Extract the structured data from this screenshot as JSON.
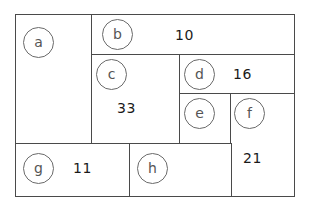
{
  "diagram": {
    "type": "treemap-partition",
    "regions": [
      {
        "id": "a",
        "label": "a",
        "value": null
      },
      {
        "id": "b",
        "label": "b",
        "value": "10"
      },
      {
        "id": "c",
        "label": "c",
        "value": "33"
      },
      {
        "id": "d",
        "label": "d",
        "value": "16"
      },
      {
        "id": "e",
        "label": "e",
        "value": null
      },
      {
        "id": "f",
        "label": "f",
        "value": "21"
      },
      {
        "id": "g",
        "label": "g",
        "value": "11"
      },
      {
        "id": "h",
        "label": "h",
        "value": null
      }
    ],
    "colors": {
      "border": "#4a4a4a",
      "circle_stroke": "#6a6a6a",
      "label_text": "#555555",
      "value_text": "#1a1a1a",
      "background": "#ffffff"
    }
  }
}
